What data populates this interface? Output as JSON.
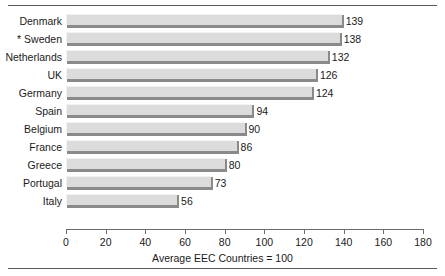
{
  "chart_data": {
    "type": "bar",
    "orientation": "horizontal",
    "title": "",
    "xlabel": "Average EEC Countries = 100",
    "ylabel": "",
    "xlim": [
      0,
      180
    ],
    "xticks": [
      0,
      20,
      40,
      60,
      80,
      100,
      120,
      140,
      160,
      180
    ],
    "grid": false,
    "legend": null,
    "categories": [
      "Denmark",
      "* Sweden",
      "Netherlands",
      "UK",
      "Germany",
      "Spain",
      "Belgium",
      "France",
      "Greece",
      "Portugal",
      "Italy"
    ],
    "values": [
      139,
      138,
      132,
      126,
      124,
      94,
      90,
      86,
      80,
      73,
      56
    ],
    "value_labels": [
      "139",
      "138",
      "132",
      "126",
      "124",
      "94",
      "90",
      "86",
      "80",
      "73",
      "56"
    ],
    "bar_fill_color": "#dcdcdc",
    "bar_shadow_color": "#8a8a8a",
    "axis_color": "#6b6b6b",
    "text_color": "#1a1a1a"
  }
}
